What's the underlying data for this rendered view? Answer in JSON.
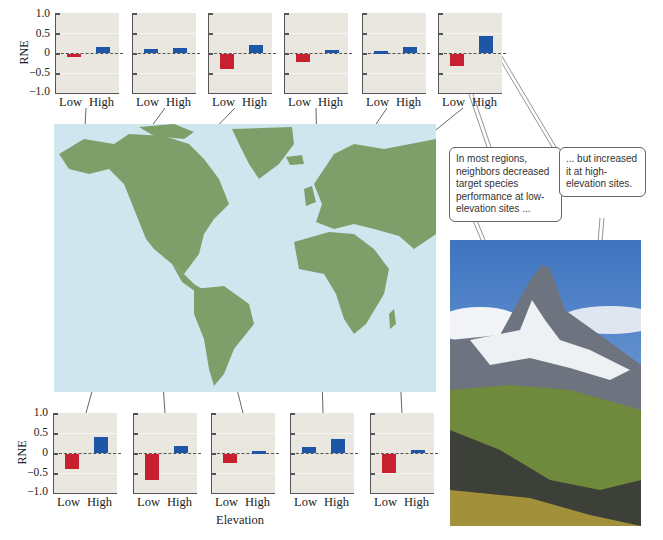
{
  "chart_data": {
    "type": "bar",
    "ylabel": "RNE",
    "xlabel": "Elevation",
    "ylim": [
      -1.0,
      1.0
    ],
    "yticks": [
      "1.0",
      "0.5",
      "0",
      "−0.5",
      "−1.0"
    ],
    "categories": [
      "Low",
      "High"
    ],
    "panels": [
      {
        "row": "top",
        "index": 1,
        "region": "Alaska",
        "values": [
          -0.07,
          0.15
        ]
      },
      {
        "row": "top",
        "index": 2,
        "region": "Western Canada",
        "values": [
          0.1,
          0.12
        ]
      },
      {
        "row": "top",
        "index": 3,
        "region": "Rocky Mountains",
        "values": [
          -0.38,
          0.2
        ]
      },
      {
        "row": "top",
        "index": 4,
        "region": "Western Europe / Alps",
        "values": [
          -0.2,
          0.07
        ]
      },
      {
        "row": "top",
        "index": 5,
        "region": "Scandinavia",
        "values": [
          0.05,
          0.15
        ]
      },
      {
        "row": "top",
        "index": 6,
        "region": "Central Europe",
        "values": [
          -0.3,
          0.42
        ]
      },
      {
        "row": "bottom",
        "index": 1,
        "region": "Western USA",
        "values": [
          -0.38,
          0.4
        ]
      },
      {
        "row": "bottom",
        "index": 2,
        "region": "Southwestern USA",
        "values": [
          -0.65,
          0.18
        ]
      },
      {
        "row": "bottom",
        "index": 3,
        "region": "Andes",
        "values": [
          -0.22,
          0.05
        ]
      },
      {
        "row": "bottom",
        "index": 4,
        "region": "Pyrenees",
        "values": [
          0.15,
          0.35
        ]
      },
      {
        "row": "bottom",
        "index": 5,
        "region": "Caucasus",
        "values": [
          -0.48,
          0.08
        ]
      }
    ],
    "colors": {
      "negative": "#c8202f",
      "positive": "#1e56a6",
      "panel_bg": "#e9e7df"
    }
  },
  "labels": {
    "rne": "RNE",
    "low": "Low",
    "high": "High",
    "elevation": "Elevation",
    "yticks": {
      "t1": "1.0",
      "t2": "0.5",
      "t3": "0",
      "t4": "−0.5",
      "t5": "−1.0"
    }
  },
  "callouts": {
    "left": "In most regions, neighbors decreased target species performance at low-elevation sites ...",
    "right": "... but increased it at high-elevation sites."
  },
  "map": {
    "ocean": "#cfe6ef",
    "land": "#7f9f6a"
  }
}
